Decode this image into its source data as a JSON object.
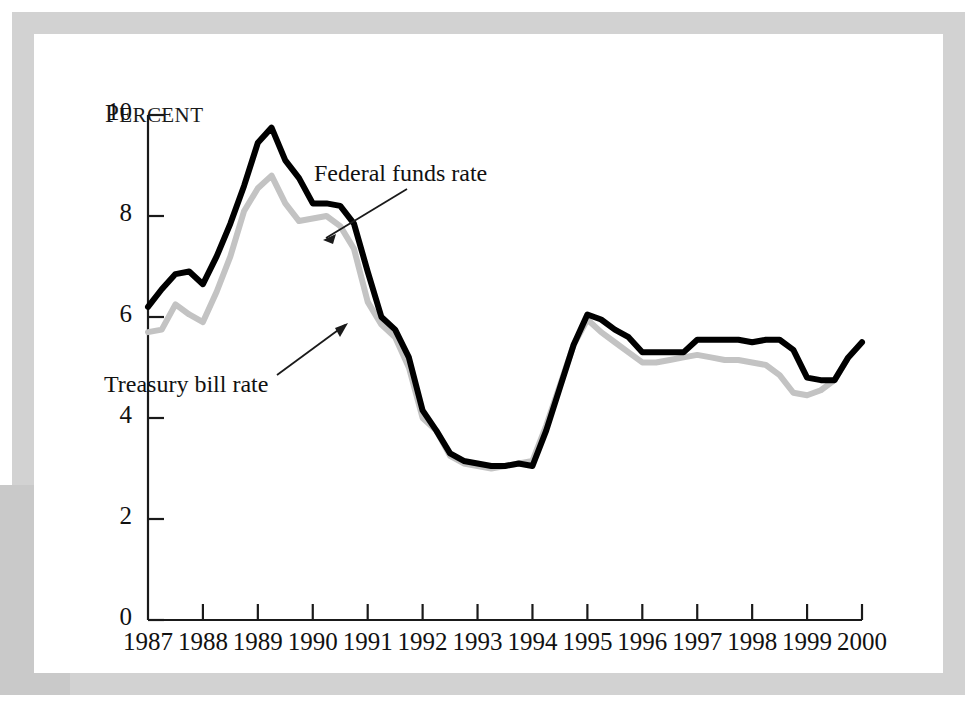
{
  "figure": {
    "unit_label": "Percent",
    "unit_label_first": "P",
    "unit_label_rest": "ERCENT"
  },
  "annotations": [
    {
      "name": "federal-funds-rate",
      "text": "Federal funds rate"
    },
    {
      "name": "treasury-bill-rate",
      "text": "Treasury bill rate"
    }
  ],
  "chart_data": {
    "type": "line",
    "title": "",
    "xlabel": "",
    "ylabel": "Percent",
    "xlim": [
      1987.0,
      2000.0
    ],
    "ylim": [
      0,
      10
    ],
    "yticks": [
      0,
      2,
      4,
      6,
      8,
      10
    ],
    "xticks": [
      1987,
      1988,
      1989,
      1990,
      1991,
      1992,
      1993,
      1994,
      1995,
      1996,
      1997,
      1998,
      1999,
      2000
    ],
    "xtick_labels": [
      "1987",
      "1988",
      "1989",
      "1990",
      "1991",
      "1992",
      "1993",
      "1994",
      "1995",
      "1996",
      "1997",
      "1998",
      "1999",
      "2000"
    ],
    "ytick_labels": [
      "0",
      "2",
      "4",
      "6",
      "8",
      "10"
    ],
    "grid": false,
    "legend": "annotations",
    "colors": {
      "federal_funds": "#000000",
      "treasury_bill": "#c3c3c3"
    },
    "series": [
      {
        "name": "Federal funds rate",
        "color": "#000000",
        "x": [
          1987.0,
          1987.25,
          1987.5,
          1987.75,
          1988.0,
          1988.25,
          1988.5,
          1988.75,
          1989.0,
          1989.25,
          1989.5,
          1989.75,
          1990.0,
          1990.25,
          1990.5,
          1990.75,
          1991.0,
          1991.25,
          1991.5,
          1991.75,
          1992.0,
          1992.25,
          1992.5,
          1992.75,
          1993.0,
          1993.25,
          1993.5,
          1993.75,
          1994.0,
          1994.25,
          1994.5,
          1994.75,
          1995.0,
          1995.25,
          1995.5,
          1995.75,
          1996.0,
          1996.25,
          1996.5,
          1996.75,
          1997.0,
          1997.25,
          1997.5,
          1997.75,
          1998.0,
          1998.25,
          1998.5,
          1998.75,
          1999.0,
          1999.25,
          1999.5,
          1999.75,
          2000.0
        ],
        "y": [
          6.2,
          6.55,
          6.85,
          6.9,
          6.65,
          7.2,
          7.85,
          8.6,
          9.45,
          9.75,
          9.1,
          8.75,
          8.25,
          8.25,
          8.2,
          7.85,
          6.9,
          6.0,
          5.75,
          5.2,
          4.15,
          3.75,
          3.3,
          3.15,
          3.1,
          3.05,
          3.05,
          3.1,
          3.05,
          3.75,
          4.6,
          5.45,
          6.05,
          5.95,
          5.75,
          5.6,
          5.3,
          5.3,
          5.3,
          5.3,
          5.55,
          5.55,
          5.55,
          5.55,
          5.5,
          5.55,
          5.55,
          5.35,
          4.8,
          4.75,
          4.75,
          5.2,
          5.5
        ],
        "notes": "Black heavy line"
      },
      {
        "name": "Treasury bill rate",
        "color": "#c3c3c3",
        "x": [
          1987.0,
          1987.25,
          1987.5,
          1987.75,
          1988.0,
          1988.25,
          1988.5,
          1988.75,
          1989.0,
          1989.25,
          1989.5,
          1989.75,
          1990.0,
          1990.25,
          1990.5,
          1990.75,
          1991.0,
          1991.25,
          1991.5,
          1991.75,
          1992.0,
          1992.25,
          1992.5,
          1992.75,
          1993.0,
          1993.25,
          1993.5,
          1993.75,
          1994.0,
          1994.25,
          1994.5,
          1994.75,
          1995.0,
          1995.25,
          1995.5,
          1995.75,
          1996.0,
          1996.25,
          1996.5,
          1996.75,
          1997.0,
          1997.25,
          1997.5,
          1997.75,
          1998.0,
          1998.25,
          1998.5,
          1998.75,
          1999.0,
          1999.25,
          1999.5,
          1999.75,
          2000.0
        ],
        "y": [
          5.7,
          5.75,
          6.25,
          6.05,
          5.9,
          6.5,
          7.2,
          8.1,
          8.55,
          8.8,
          8.25,
          7.9,
          7.95,
          8.0,
          7.8,
          7.35,
          6.3,
          5.85,
          5.6,
          5.0,
          4.0,
          3.75,
          3.25,
          3.1,
          3.05,
          3.0,
          3.05,
          3.1,
          3.15,
          3.85,
          4.65,
          5.45,
          5.95,
          5.7,
          5.5,
          5.3,
          5.1,
          5.1,
          5.15,
          5.2,
          5.25,
          5.2,
          5.15,
          5.15,
          5.1,
          5.05,
          4.85,
          4.5,
          4.45,
          4.55,
          4.75,
          5.2,
          5.5
        ],
        "notes": "Light gray heavy line"
      }
    ]
  }
}
